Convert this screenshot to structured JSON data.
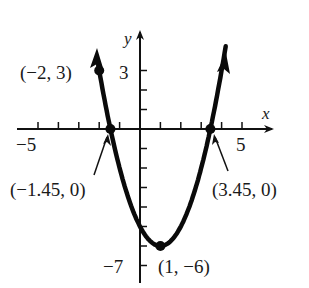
{
  "chart_data": {
    "type": "line",
    "title": "",
    "function": "y = x^2 - 2x - 5",
    "xlabel": "x",
    "ylabel": "y",
    "xlim": [
      -6,
      6
    ],
    "ylim": [
      -7.5,
      4.5
    ],
    "x_tick_labels": [
      "-5",
      "5"
    ],
    "y_tick_labels": [
      "3",
      "-7"
    ],
    "x_ticks": [
      -5,
      -4,
      -3,
      -2,
      -1,
      1,
      2,
      3,
      4,
      5
    ],
    "y_ticks": [
      3,
      2,
      1,
      -1,
      -2,
      -3,
      -4,
      -5,
      -6,
      -7
    ],
    "grid": false,
    "legend": "none",
    "series": [
      {
        "name": "parabola",
        "x": [
          -2.05,
          -2,
          -1.45,
          -1,
          0,
          1,
          2,
          3,
          3.45,
          4.2
        ],
        "y": [
          4.0,
          3,
          0,
          -2,
          -5,
          -6,
          -5,
          -2,
          0,
          3.24
        ]
      }
    ],
    "points": [
      {
        "label": "(−2, 3)",
        "x": -2,
        "y": 3
      },
      {
        "label": "(−1.45, 0)",
        "x": -1.45,
        "y": 0
      },
      {
        "label": "(3.45, 0)",
        "x": 3.45,
        "y": 0
      },
      {
        "label": "(1, −6)",
        "x": 1,
        "y": -6
      }
    ]
  },
  "labels": {
    "y_axis": "y",
    "x_axis": "x",
    "tick_neg5": "−5",
    "tick_5": "5",
    "tick_3": "3",
    "tick_neg7": "−7",
    "pt_a": "(−2, 3)",
    "pt_b": "(−1.45, 0)",
    "pt_c": "(3.45, 0)",
    "pt_d": "(1, −6)"
  }
}
